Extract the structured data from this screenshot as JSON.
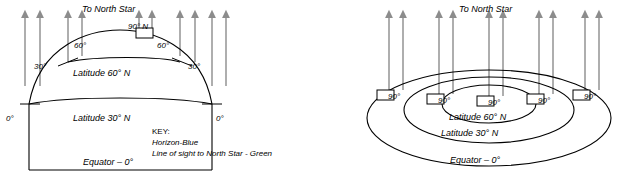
{
  "figure": {
    "background": "#ffffff",
    "stroke": "#000000",
    "arrow_color": "#8c8c8c",
    "box_fill": "#ffffff"
  },
  "left_panel": {
    "name": "side-view-earth-diagram",
    "title": "To North Star",
    "angle_labels": [
      {
        "text": "90° N",
        "x": 139,
        "y": 32
      },
      {
        "text": "60°",
        "x": 81,
        "y": 46
      },
      {
        "text": "60°",
        "x": 166,
        "y": 46
      },
      {
        "text": "30°",
        "x": 42,
        "y": 66
      },
      {
        "text": "30°",
        "x": 195,
        "y": 66
      },
      {
        "text": "0°",
        "x": 13,
        "y": 118
      },
      {
        "text": "0°",
        "x": 223,
        "y": 118
      }
    ],
    "latitude_labels": [
      {
        "text": "Latitude 60° N",
        "x": 75,
        "y": 73
      },
      {
        "text": "Latitude 30° N",
        "x": 75,
        "y": 118
      },
      {
        "text": "Equator – 0°",
        "x": 85,
        "y": 162
      }
    ],
    "key": {
      "title": "KEY:",
      "lines": [
        "Horizon-Blue",
        "Line of sight to North Star - Green"
      ]
    }
  },
  "right_panel": {
    "name": "perspective-earth-diagram",
    "title": "To North Star",
    "angle_labels": [
      {
        "text": "90°",
        "x": 383,
        "y": 95
      },
      {
        "text": "90°",
        "x": 433,
        "y": 99
      },
      {
        "text": "90°",
        "x": 483,
        "y": 101
      },
      {
        "text": "90°",
        "x": 533,
        "y": 99
      },
      {
        "text": "90°",
        "x": 578,
        "y": 95
      }
    ],
    "latitude_labels": [
      {
        "text": "Latitude 60° N",
        "x": 452,
        "y": 117
      },
      {
        "text": "Latitude 30° N",
        "x": 444,
        "y": 133
      },
      {
        "text": "Equator – 0°",
        "x": 452,
        "y": 160
      }
    ]
  }
}
